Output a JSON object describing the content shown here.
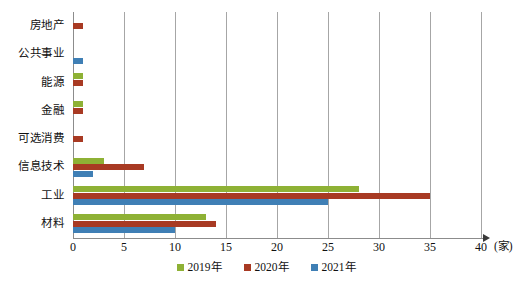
{
  "chart_data": {
    "type": "bar",
    "orientation": "horizontal",
    "title": "",
    "xlabel": "(家)",
    "ylabel": "",
    "xlim": [
      0,
      40
    ],
    "xticks": [
      0,
      5,
      10,
      15,
      20,
      25,
      30,
      35,
      40
    ],
    "grid": true,
    "legend_position": "bottom-center",
    "categories": [
      "房地产",
      "公共事业",
      "能源",
      "金融",
      "可选消费",
      "信息技术",
      "工业",
      "材料"
    ],
    "series": [
      {
        "name": "2019年",
        "color": "#8eb135",
        "values": [
          0,
          0,
          1,
          1,
          0,
          3,
          28,
          13
        ]
      },
      {
        "name": "2020年",
        "color": "#a83a23",
        "values": [
          1,
          0,
          1,
          1,
          1,
          7,
          35,
          14
        ]
      },
      {
        "name": "2021年",
        "color": "#3f7fb5",
        "values": [
          0,
          1,
          0,
          0,
          0,
          2,
          25,
          10
        ]
      }
    ]
  },
  "axis": {
    "unit_label": "(家)",
    "tick_labels": [
      "0",
      "5",
      "10",
      "15",
      "20",
      "25",
      "30",
      "35",
      "40"
    ]
  },
  "categories": {
    "c0": "房地产",
    "c1": "公共事业",
    "c2": "能源",
    "c3": "金融",
    "c4": "可选消费",
    "c5": "信息技术",
    "c6": "工业",
    "c7": "材料"
  },
  "legend": {
    "items": [
      {
        "label": "2019年",
        "color": "#8eb135"
      },
      {
        "label": "2020年",
        "color": "#a83a23"
      },
      {
        "label": "2021年",
        "color": "#3f7fb5"
      }
    ]
  }
}
